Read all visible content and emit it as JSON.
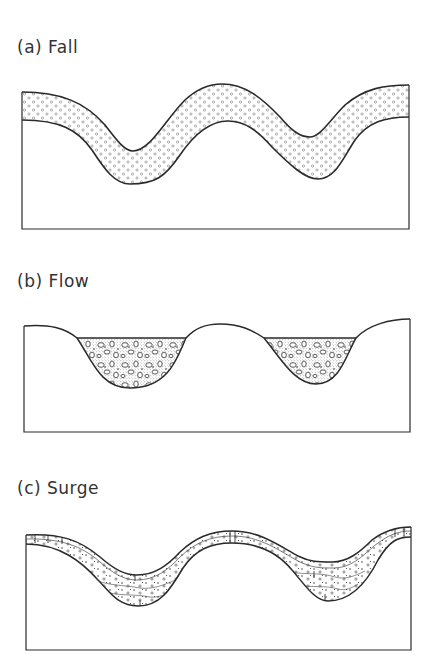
{
  "figure": {
    "panels": [
      {
        "id": "a",
        "label": "(a) Fall",
        "deposit_type": "fall",
        "description": "Mantle-bedded deposit of uniform thickness draping topography",
        "fill_pattern": "small-open-circles"
      },
      {
        "id": "b",
        "label": "(b) Flow",
        "deposit_type": "flow",
        "description": "Ponded deposit filling valleys with flat top surface",
        "fill_pattern": "stippled-with-clasts"
      },
      {
        "id": "c",
        "label": "(c) Surge",
        "deposit_type": "surge",
        "description": "Stratified deposit thickening in depressions, thinning over highs",
        "fill_pattern": "layered-with-dots"
      }
    ]
  },
  "colors": {
    "line": "#2a2a2a",
    "background": "#ffffff",
    "stipple": "#8a8a8a"
  }
}
